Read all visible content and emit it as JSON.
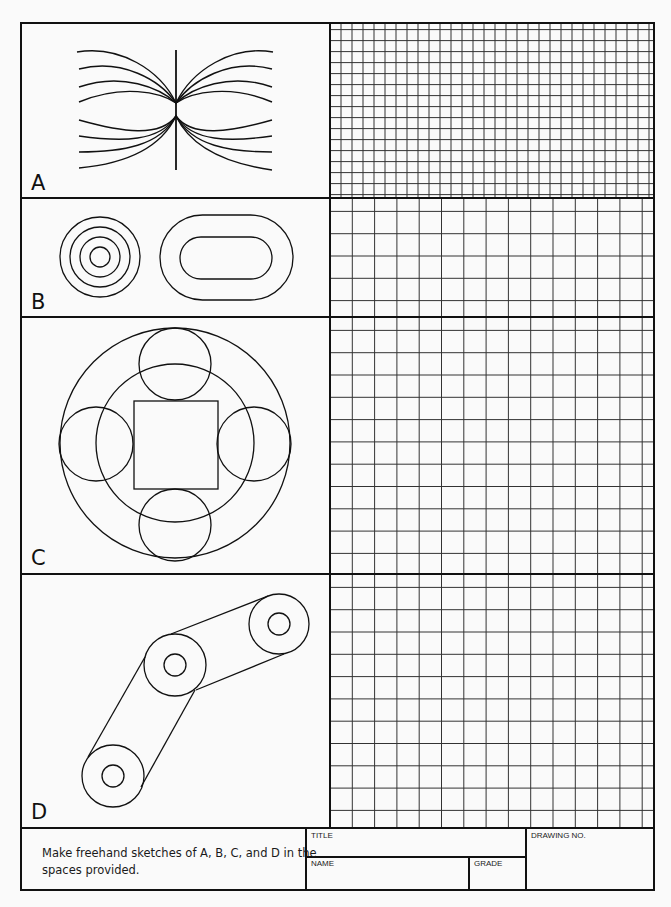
{
  "worksheet": {
    "panels": [
      {
        "label": "A",
        "figure": "field-lines",
        "grid": "fine"
      },
      {
        "label": "B",
        "figure": "concentric-circles-and-stadium",
        "grid": "coarse"
      },
      {
        "label": "C",
        "figure": "circles-and-square",
        "grid": "coarse"
      },
      {
        "label": "D",
        "figure": "belt-and-pulleys",
        "grid": "coarse"
      }
    ]
  },
  "title_block": {
    "instructions": [
      "Make freehand sketches of A, B, C, and D in the",
      "spaces provided."
    ],
    "title_label": "TITLE",
    "name_label": "NAME",
    "grade_label": "GRADE",
    "drawing_no_label": "DRAWING NO."
  },
  "colors": {
    "ink": "#1a1a1a",
    "grid": "#333333",
    "paper": "#fafafa"
  }
}
